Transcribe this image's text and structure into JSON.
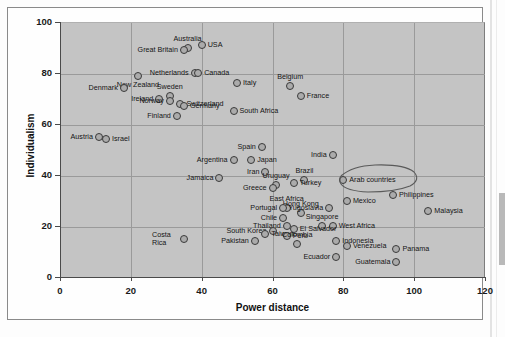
{
  "chart_data": {
    "type": "scatter",
    "title": "",
    "xlabel": "Power distance",
    "ylabel": "Individualism",
    "xlim": [
      0,
      120
    ],
    "ylim": [
      0,
      100
    ],
    "xticks": [
      "0",
      "20",
      "40",
      "60",
      "80",
      "100",
      "120"
    ],
    "yticks": [
      "0",
      "20",
      "40",
      "60",
      "80",
      "100"
    ],
    "grid": true,
    "legend": "none",
    "marker": "open-circle",
    "points": [
      {
        "label": "Australia",
        "x": 36,
        "y": 90,
        "lpos": "t"
      },
      {
        "label": "USA",
        "x": 40,
        "y": 91,
        "lpos": "l"
      },
      {
        "label": "Great Britain",
        "x": 35,
        "y": 89,
        "lpos": "r"
      },
      {
        "label": "Netherlands",
        "x": 38,
        "y": 80,
        "lpos": "r"
      },
      {
        "label": "Canada",
        "x": 39,
        "y": 80,
        "lpos": "l"
      },
      {
        "label": "New Zealand",
        "x": 22,
        "y": 79,
        "lpos": "b"
      },
      {
        "label": "Denmark",
        "x": 18,
        "y": 74,
        "lpos": "r"
      },
      {
        "label": "Italy",
        "x": 50,
        "y": 76,
        "lpos": "l"
      },
      {
        "label": "Belgium",
        "x": 65,
        "y": 75,
        "lpos": "t"
      },
      {
        "label": "France",
        "x": 68,
        "y": 71,
        "lpos": "l"
      },
      {
        "label": "Sweden",
        "x": 31,
        "y": 71,
        "lpos": "t"
      },
      {
        "label": "Ireland",
        "x": 28,
        "y": 70,
        "lpos": "r"
      },
      {
        "label": "Switzerland",
        "x": 34,
        "y": 68,
        "lpos": "l"
      },
      {
        "label": "Norway",
        "x": 31,
        "y": 69,
        "lpos": "r"
      },
      {
        "label": "Germany",
        "x": 35,
        "y": 67,
        "lpos": "l"
      },
      {
        "label": "South Africa",
        "x": 49,
        "y": 65,
        "lpos": "l"
      },
      {
        "label": "Finland",
        "x": 33,
        "y": 63,
        "lpos": "r"
      },
      {
        "label": "Austria",
        "x": 11,
        "y": 55,
        "lpos": "r"
      },
      {
        "label": "Israel",
        "x": 13,
        "y": 54,
        "lpos": "l"
      },
      {
        "label": "Spain",
        "x": 57,
        "y": 51,
        "lpos": "r"
      },
      {
        "label": "India",
        "x": 77,
        "y": 48,
        "lpos": "r"
      },
      {
        "label": "Argentina",
        "x": 49,
        "y": 46,
        "lpos": "r"
      },
      {
        "label": "Japan",
        "x": 54,
        "y": 46,
        "lpos": "l"
      },
      {
        "label": "Iran",
        "x": 58,
        "y": 41,
        "lpos": "r"
      },
      {
        "label": "Jamaica",
        "x": 45,
        "y": 39,
        "lpos": "r"
      },
      {
        "label": "Brazil",
        "x": 69,
        "y": 38,
        "lpos": "t"
      },
      {
        "label": "Uruguay",
        "x": 61,
        "y": 36,
        "lpos": "t"
      },
      {
        "label": "Arab countries",
        "x": 80,
        "y": 38,
        "lpos": "l"
      },
      {
        "label": "Turkey",
        "x": 66,
        "y": 37,
        "lpos": "l"
      },
      {
        "label": "Greece",
        "x": 60,
        "y": 35,
        "lpos": "r"
      },
      {
        "label": "Philippines",
        "x": 94,
        "y": 32,
        "lpos": "l"
      },
      {
        "label": "East Africa",
        "x": 64,
        "y": 27,
        "lpos": "t"
      },
      {
        "label": "Hong Kong",
        "x": 68,
        "y": 25,
        "lpos": "t"
      },
      {
        "label": "Portugal",
        "x": 63,
        "y": 27,
        "lpos": "r"
      },
      {
        "label": "Yugoslavia",
        "x": 76,
        "y": 27,
        "lpos": "r"
      },
      {
        "label": "Mexico",
        "x": 81,
        "y": 30,
        "lpos": "l"
      },
      {
        "label": "Malaysia",
        "x": 104,
        "y": 26,
        "lpos": "l"
      },
      {
        "label": "Chile",
        "x": 63,
        "y": 23,
        "lpos": "r"
      },
      {
        "label": "Singapore",
        "x": 74,
        "y": 20,
        "lpos": "t"
      },
      {
        "label": "Thailand",
        "x": 64,
        "y": 20,
        "lpos": "r"
      },
      {
        "label": "West Africa",
        "x": 77,
        "y": 20,
        "lpos": "l"
      },
      {
        "label": "South Korea",
        "x": 60,
        "y": 18,
        "lpos": "r"
      },
      {
        "label": "El Salvador",
        "x": 66,
        "y": 19,
        "lpos": "l"
      },
      {
        "label": "Indonesia",
        "x": 78,
        "y": 14,
        "lpos": "l"
      },
      {
        "label": "Taiwan",
        "x": 58,
        "y": 17,
        "lpos": "l"
      },
      {
        "label": "Peru",
        "x": 64,
        "y": 16,
        "lpos": "l"
      },
      {
        "label": "Pakistan",
        "x": 55,
        "y": 14,
        "lpos": "r"
      },
      {
        "label": "Colombia",
        "x": 67,
        "y": 13,
        "lpos": "t"
      },
      {
        "label": "Venezuela",
        "x": 81,
        "y": 12,
        "lpos": "l"
      },
      {
        "label": "Panama",
        "x": 95,
        "y": 11,
        "lpos": "l"
      },
      {
        "label": "Costa Rica",
        "x": 35,
        "y": 15,
        "lpos": "r2"
      },
      {
        "label": "Ecuador",
        "x": 78,
        "y": 8,
        "lpos": "r"
      },
      {
        "label": "Guatemala",
        "x": 95,
        "y": 6,
        "lpos": "r"
      }
    ],
    "annotations": [
      {
        "kind": "hand-drawn-ellipse",
        "target": "Arab countries"
      }
    ]
  }
}
